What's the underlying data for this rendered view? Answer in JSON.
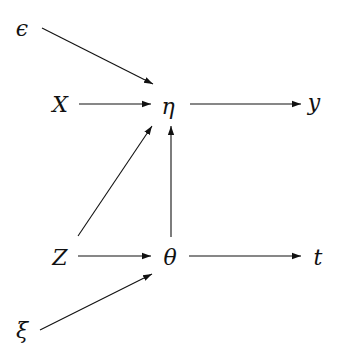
{
  "diagram": {
    "type": "causal-graph",
    "nodes": {
      "epsilon": {
        "label": "ϵ",
        "x": 22,
        "y": 28
      },
      "X": {
        "label": "X",
        "x": 60,
        "y": 104
      },
      "eta": {
        "label": "η",
        "x": 168,
        "y": 104
      },
      "y": {
        "label": "y",
        "x": 314,
        "y": 104
      },
      "Z": {
        "label": "Z",
        "x": 60,
        "y": 257
      },
      "theta": {
        "label": "θ",
        "x": 170,
        "y": 257
      },
      "t": {
        "label": "t",
        "x": 318,
        "y": 257
      },
      "xi": {
        "label": "ξ",
        "x": 22,
        "y": 330
      }
    },
    "edges": [
      {
        "from": "epsilon",
        "to": "eta"
      },
      {
        "from": "X",
        "to": "eta"
      },
      {
        "from": "eta",
        "to": "y"
      },
      {
        "from": "Z",
        "to": "eta"
      },
      {
        "from": "theta",
        "to": "eta"
      },
      {
        "from": "Z",
        "to": "theta"
      },
      {
        "from": "theta",
        "to": "t"
      },
      {
        "from": "xi",
        "to": "theta"
      }
    ]
  }
}
